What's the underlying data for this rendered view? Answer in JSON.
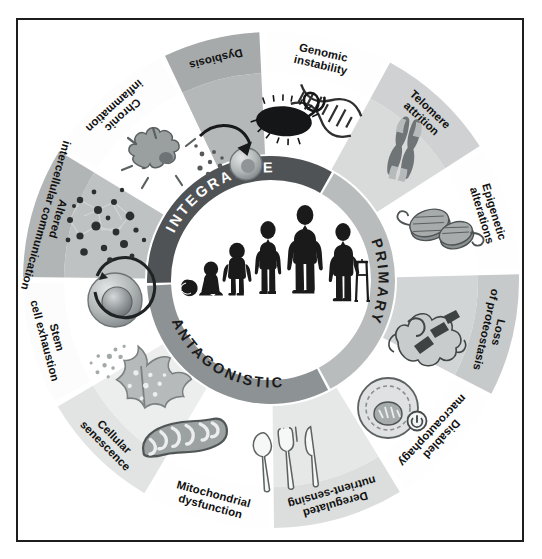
{
  "figure": {
    "border_color": "#1d1d1d",
    "background": "#ffffff"
  },
  "center": {
    "background": "#ffffff",
    "figures": [
      {
        "name": "embryo",
        "label": "embryo"
      },
      {
        "name": "infant-sitting",
        "label": "infant"
      },
      {
        "name": "toddler",
        "label": "toddler"
      },
      {
        "name": "child",
        "label": "child"
      },
      {
        "name": "adult",
        "label": "adult"
      },
      {
        "name": "elderly-with-walker",
        "label": "elderly"
      }
    ]
  },
  "inner_ring": {
    "segments": [
      {
        "id": "primary",
        "label": "PRIMARY",
        "color": "#b9bcbd",
        "text_color": "#1b1b1b",
        "start_deg": -60,
        "end_deg": 62
      },
      {
        "id": "antagonistic",
        "label": "ANTAGONISTIC",
        "color": "#8d9294",
        "text_color": "#1b1b1b",
        "start_deg": 62,
        "end_deg": 178
      },
      {
        "id": "integrative",
        "label": "INTEGRATIVE",
        "color": "#4f5355",
        "text_color": "#fdfdfd",
        "start_deg": 178,
        "end_deg": 300
      }
    ]
  },
  "outer_ring": {
    "segments": [
      {
        "id": "genomic-instability",
        "label": "Genomic instability",
        "group": "primary",
        "band": "#fefefe",
        "wedge": "#ffffff",
        "icon": "dna-helix-icon",
        "start_deg": -92,
        "end_deg": -62
      },
      {
        "id": "telomere-attrition",
        "label": "Telomere attrition",
        "group": "primary",
        "band": "#cfd1d2",
        "wedge": "#d9dbdb",
        "icon": "chromosome-icon",
        "start_deg": -62,
        "end_deg": -32
      },
      {
        "id": "epigenetic-alterations",
        "label": "Epigenetic alterations",
        "group": "primary",
        "band": "#fefefe",
        "wedge": "#ffffff",
        "icon": "nucleosome-icon",
        "start_deg": -32,
        "end_deg": -2
      },
      {
        "id": "loss-of-proteostasis",
        "label": "Loss of proteostasis",
        "group": "primary",
        "band": "#c7cacb",
        "wedge": "#d2d5d5",
        "icon": "misfolded-protein-icon",
        "start_deg": -2,
        "end_deg": 28
      },
      {
        "id": "disabled-macroautophagy",
        "label": "Disabled macroautophagy",
        "group": "primary",
        "band": "#fefefe",
        "wedge": "#ffffff",
        "icon": "autophagosome-icon",
        "start_deg": 28,
        "end_deg": 58
      },
      {
        "id": "deregulated-nutrient-sensing",
        "label": "Deregulated nutrient-sensing",
        "group": "antagonistic",
        "band": "#dcdedd",
        "wedge": "#e6e8e7",
        "icon": "cutlery-icon",
        "start_deg": 58,
        "end_deg": 90
      },
      {
        "id": "mitochondrial-dysfunction",
        "label": "Mitochondrial dysfunction",
        "group": "antagonistic",
        "band": "#fefefe",
        "wedge": "#ffffff",
        "icon": "mitochondrion-icon",
        "start_deg": 90,
        "end_deg": 120
      },
      {
        "id": "cellular-senescence",
        "label": "Cellular senescence",
        "group": "antagonistic",
        "band": "#e2e4e3",
        "wedge": "#eceeed",
        "icon": "senescent-cell-icon",
        "start_deg": 120,
        "end_deg": 150
      },
      {
        "id": "stem-cell-exhaustion",
        "label": "Stem cell exhaustion",
        "group": "antagonistic",
        "band": "#fcfcfc",
        "wedge": "#ffffff",
        "icon": "stem-cell-icon",
        "start_deg": 150,
        "end_deg": 180
      },
      {
        "id": "altered-intercellular-communication",
        "label": "Altered intercellular communication",
        "group": "integrative",
        "band": "#b2b5b6",
        "wedge": "#bfc2c3",
        "icon": "cell-network-icon",
        "start_deg": 180,
        "end_deg": 212
      },
      {
        "id": "chronic-inflammation",
        "label": "Chronic inflammation",
        "group": "integrative",
        "band": "#fdfdfd",
        "wedge": "#ffffff",
        "icon": "macrophage-cytokine-icon",
        "start_deg": 212,
        "end_deg": 244
      },
      {
        "id": "dysbiosis",
        "label": "Dysbiosis",
        "group": "integrative",
        "band": "#a6aaab",
        "wedge": "#b4b8b8",
        "icon": "bacterium-icon",
        "start_deg": 244,
        "end_deg": 268
      }
    ]
  },
  "palette": {
    "ink": "#1d1d1d",
    "dark_ring": "#4f5355",
    "mid_ring": "#8d9294",
    "light_ring": "#b9bcbd",
    "icon_dark": "#2b2b2b",
    "icon_mid": "#7d8183",
    "icon_light": "#c3c6c7"
  }
}
